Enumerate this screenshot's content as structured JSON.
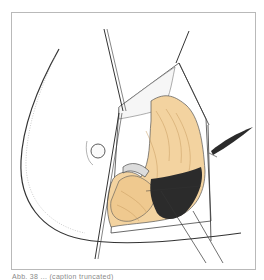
{
  "illustration": {
    "subject": "surgical-field-illustration",
    "colors": {
      "tissue": "#f3d3a0",
      "tissue_shade": "#e2b77c",
      "dark_tissue": "#2b2b2b",
      "line": "#333333",
      "frame": "#b9b9b9",
      "background": "#ffffff"
    }
  },
  "caption": {
    "text": "Abb. 38 ... (caption truncated)"
  }
}
